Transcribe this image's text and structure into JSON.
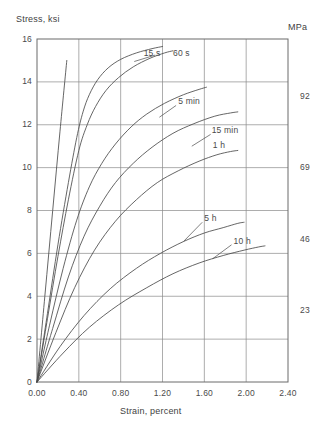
{
  "chart_data": {
    "type": "line",
    "title": "",
    "xlabel": "Strain, percent",
    "ylabel": "Stress, ksi",
    "y2label": "MPa",
    "xlim": [
      0.0,
      2.4
    ],
    "ylim": [
      0,
      16
    ],
    "grid": true,
    "legend_position": "inline-annotations",
    "xticks": [
      "0.00",
      "0.40",
      "0.80",
      "1.20",
      "1.60",
      "2.00",
      "2.40"
    ],
    "xtick_values": [
      0.0,
      0.4,
      0.8,
      1.2,
      1.6,
      2.0,
      2.4
    ],
    "yticks": [
      "0",
      "2",
      "4",
      "6",
      "8",
      "10",
      "12",
      "14",
      "16"
    ],
    "ytick_values": [
      0,
      2,
      4,
      6,
      8,
      10,
      12,
      14,
      16
    ],
    "y2ticks": [
      "23",
      "46",
      "69",
      "92"
    ],
    "y2tick_ksi_values": [
      3.34,
      6.67,
      10.01,
      13.34
    ],
    "series": [
      {
        "name": "modulus-line",
        "label": "",
        "points": [
          [
            0.0,
            0.0
          ],
          [
            0.075,
            4.0
          ],
          [
            0.15,
            8.0
          ],
          [
            0.22,
            11.7
          ],
          [
            0.285,
            15.0
          ]
        ]
      },
      {
        "name": "15 s",
        "label": "15 s",
        "label_x": 1.02,
        "label_y": 15.35,
        "points": [
          [
            0.0,
            0.0
          ],
          [
            0.1,
            3.2
          ],
          [
            0.2,
            6.4
          ],
          [
            0.3,
            9.3
          ],
          [
            0.38,
            11.4
          ],
          [
            0.44,
            12.6
          ],
          [
            0.5,
            13.4
          ],
          [
            0.58,
            14.1
          ],
          [
            0.68,
            14.65
          ],
          [
            0.8,
            15.05
          ],
          [
            0.95,
            15.35
          ],
          [
            1.1,
            15.55
          ],
          [
            1.2,
            15.65
          ]
        ]
      },
      {
        "name": "60 s",
        "label": "60 s",
        "label_x": 1.3,
        "label_y": 15.35,
        "points": [
          [
            0.0,
            0.0
          ],
          [
            0.1,
            2.95
          ],
          [
            0.2,
            5.85
          ],
          [
            0.3,
            8.5
          ],
          [
            0.4,
            10.8
          ],
          [
            0.48,
            12.0
          ],
          [
            0.56,
            12.85
          ],
          [
            0.66,
            13.6
          ],
          [
            0.78,
            14.2
          ],
          [
            0.92,
            14.7
          ],
          [
            1.08,
            15.1
          ],
          [
            1.22,
            15.35
          ],
          [
            1.3,
            15.45
          ]
        ]
      },
      {
        "name": "5 min",
        "label": "5 min",
        "label_x": 1.35,
        "label_y": 13.1,
        "points": [
          [
            0.0,
            0.0
          ],
          [
            0.12,
            2.65
          ],
          [
            0.25,
            5.3
          ],
          [
            0.38,
            7.55
          ],
          [
            0.5,
            9.1
          ],
          [
            0.62,
            10.2
          ],
          [
            0.75,
            11.1
          ],
          [
            0.9,
            11.9
          ],
          [
            1.05,
            12.5
          ],
          [
            1.22,
            13.0
          ],
          [
            1.4,
            13.4
          ],
          [
            1.55,
            13.65
          ],
          [
            1.62,
            13.75
          ]
        ]
      },
      {
        "name": "15 min",
        "label": "15 min",
        "label_x": 1.67,
        "label_y": 11.75,
        "points": [
          [
            0.0,
            0.0
          ],
          [
            0.15,
            2.5
          ],
          [
            0.3,
            4.9
          ],
          [
            0.45,
            6.8
          ],
          [
            0.6,
            8.2
          ],
          [
            0.75,
            9.3
          ],
          [
            0.92,
            10.2
          ],
          [
            1.1,
            10.95
          ],
          [
            1.3,
            11.6
          ],
          [
            1.5,
            12.05
          ],
          [
            1.7,
            12.4
          ],
          [
            1.85,
            12.55
          ],
          [
            1.92,
            12.6
          ]
        ]
      },
      {
        "name": "1 h",
        "label": "1 h",
        "label_x": 1.68,
        "label_y": 11.05,
        "points": [
          [
            0.0,
            0.0
          ],
          [
            0.18,
            2.3
          ],
          [
            0.36,
            4.4
          ],
          [
            0.55,
            6.15
          ],
          [
            0.75,
            7.5
          ],
          [
            0.95,
            8.5
          ],
          [
            1.15,
            9.3
          ],
          [
            1.35,
            9.85
          ],
          [
            1.55,
            10.3
          ],
          [
            1.72,
            10.6
          ],
          [
            1.85,
            10.75
          ],
          [
            1.92,
            10.8
          ]
        ]
      },
      {
        "name": "5 h",
        "label": "5 h",
        "label_x": 1.6,
        "label_y": 7.65,
        "points": [
          [
            0.0,
            0.0
          ],
          [
            0.22,
            1.65
          ],
          [
            0.45,
            3.1
          ],
          [
            0.7,
            4.35
          ],
          [
            0.95,
            5.3
          ],
          [
            1.18,
            6.0
          ],
          [
            1.4,
            6.55
          ],
          [
            1.6,
            6.95
          ],
          [
            1.78,
            7.2
          ],
          [
            1.92,
            7.4
          ],
          [
            1.98,
            7.45
          ]
        ]
      },
      {
        "name": "10 h",
        "label": "10 h",
        "label_x": 1.88,
        "label_y": 6.6,
        "points": [
          [
            0.0,
            0.0
          ],
          [
            0.25,
            1.35
          ],
          [
            0.5,
            2.55
          ],
          [
            0.78,
            3.6
          ],
          [
            1.05,
            4.4
          ],
          [
            1.3,
            5.05
          ],
          [
            1.55,
            5.55
          ],
          [
            1.78,
            5.9
          ],
          [
            1.98,
            6.15
          ],
          [
            2.12,
            6.3
          ],
          [
            2.18,
            6.35
          ]
        ]
      }
    ]
  },
  "axes": {
    "y_title": "Stress, ksi",
    "y2_title": "MPa",
    "x_title": "Strain, percent"
  }
}
